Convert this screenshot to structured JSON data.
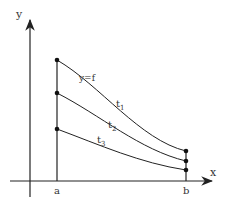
{
  "diagram": {
    "axes": {
      "x_label": "x",
      "y_label": "y"
    },
    "points": {
      "a_label": "a",
      "b_label": "b"
    },
    "curves": [
      {
        "label": "y=f",
        "name": "f"
      },
      {
        "label": "t",
        "sub": "1"
      },
      {
        "label": "t",
        "sub": "2"
      },
      {
        "label": "t",
        "sub": "3"
      }
    ],
    "colors": {
      "stroke": "#222222",
      "text": "#333333"
    }
  }
}
